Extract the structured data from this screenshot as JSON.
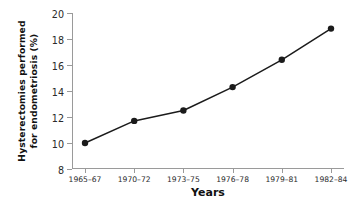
{
  "chart_data": {
    "type": "line",
    "title": "",
    "xlabel": "Years",
    "ylabel_line1": "Hysterectomies performed",
    "ylabel_line2": "for endometriosis (%)",
    "ylabel": "Hysterectomies performed for endometriosis (%)",
    "categories": [
      "1965–67",
      "1970–72",
      "1973–75",
      "1976–78",
      "1979–81",
      "1982–84"
    ],
    "values": [
      10.0,
      11.7,
      12.5,
      14.3,
      16.4,
      18.8
    ],
    "ylim": [
      8,
      20
    ],
    "yticks": [
      8,
      10,
      12,
      14,
      16,
      18,
      20
    ],
    "ytick_labels": [
      "8",
      "10",
      "12",
      "14",
      "16",
      "18",
      "20"
    ],
    "grid": false,
    "legend": "none",
    "series": [
      {
        "name": "Hysterectomies performed for endometriosis (%)",
        "values": [
          10.0,
          11.7,
          12.5,
          14.3,
          16.4,
          18.8
        ],
        "marker": "filled-circle",
        "color": "#1b1b1b"
      }
    ],
    "colors": {
      "line": "#1b1b1b",
      "marker": "#1b1b1b",
      "axis": "#9a9a9a",
      "text": "#111111",
      "background": "#ffffff"
    }
  }
}
